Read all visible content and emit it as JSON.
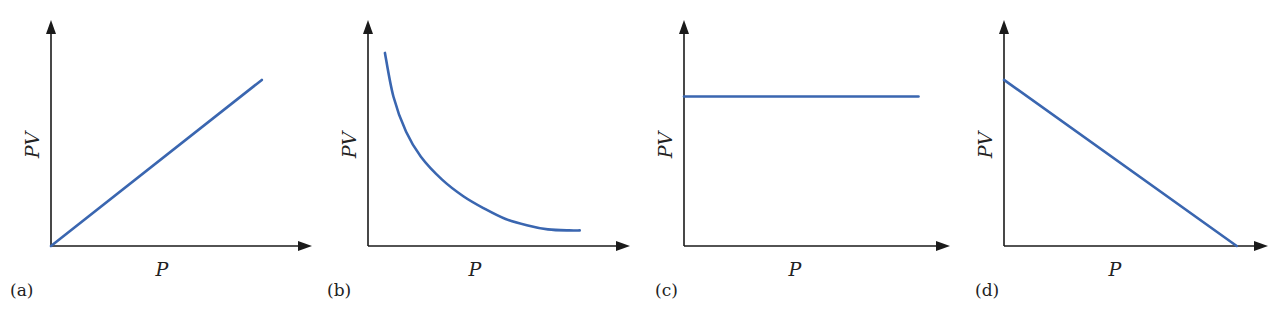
{
  "chart_data": [
    {
      "type": "line",
      "panel": "(a)",
      "xlabel": "P",
      "ylabel": "PV",
      "description": "PV increases linearly with P from the origin",
      "x": [
        0,
        1
      ],
      "y": [
        0,
        0.8
      ],
      "xlim": [
        0,
        1.2
      ],
      "ylim": [
        0,
        1.05
      ],
      "line_color": "#3a66b0"
    },
    {
      "type": "line",
      "panel": "(b)",
      "xlabel": "P",
      "ylabel": "PV",
      "description": "PV decreases hyperbolically with P",
      "x": [
        0.08,
        0.12,
        0.18,
        0.25,
        0.35,
        0.45,
        0.55,
        0.65,
        0.75,
        0.85,
        0.95,
        1.0
      ],
      "y": [
        0.93,
        0.72,
        0.55,
        0.43,
        0.32,
        0.24,
        0.18,
        0.13,
        0.1,
        0.08,
        0.075,
        0.075
      ],
      "xlim": [
        0,
        1.2
      ],
      "ylim": [
        0,
        1.05
      ],
      "line_color": "#3a66b0"
    },
    {
      "type": "line",
      "panel": "(c)",
      "xlabel": "P",
      "ylabel": "PV",
      "description": "PV is constant, independent of P",
      "x": [
        0,
        1.0
      ],
      "y": [
        0.72,
        0.72
      ],
      "xlim": [
        0,
        1.1
      ],
      "ylim": [
        0,
        1.05
      ],
      "line_color": "#3a66b0"
    },
    {
      "type": "line",
      "panel": "(d)",
      "xlabel": "P",
      "ylabel": "PV",
      "description": "PV decreases linearly with P, reaching zero on the P axis",
      "x": [
        0,
        1.0
      ],
      "y": [
        0.8,
        0
      ],
      "xlim": [
        0,
        1.1
      ],
      "ylim": [
        0,
        1.05
      ],
      "line_color": "#3a66b0"
    }
  ]
}
